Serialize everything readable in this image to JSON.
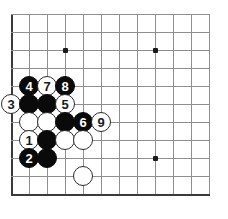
{
  "diagram": {
    "type": "go-board-diagram",
    "board": {
      "background_color": "#ffffff",
      "line_color": "#8f8f8f",
      "edge_color": "#3a3a3a",
      "origin_x": 11,
      "origin_y": 14,
      "cell_size": 18,
      "vertical_lines": 12,
      "horizontal_lines": 11,
      "edges": [
        "left",
        "bottom"
      ]
    },
    "star_points": [
      {
        "name": "star-point-upper-left",
        "x": 65,
        "y": 50
      },
      {
        "name": "star-point-upper-right",
        "x": 155,
        "y": 50
      },
      {
        "name": "star-point-lower-right",
        "x": 155,
        "y": 158
      }
    ],
    "stones": [
      {
        "id": "stone-4",
        "color": "black",
        "label": "4",
        "x": 29,
        "y": 86
      },
      {
        "id": "stone-7",
        "color": "white",
        "label": "7",
        "x": 47,
        "y": 86
      },
      {
        "id": "stone-8",
        "color": "black",
        "label": "8",
        "x": 65,
        "y": 86
      },
      {
        "id": "stone-3",
        "color": "white",
        "label": "3",
        "x": 11,
        "y": 104
      },
      {
        "id": "stone-b1",
        "color": "black",
        "label": "",
        "x": 29,
        "y": 104
      },
      {
        "id": "stone-b2",
        "color": "black",
        "label": "",
        "x": 47,
        "y": 104
      },
      {
        "id": "stone-5",
        "color": "white",
        "label": "5",
        "x": 65,
        "y": 104
      },
      {
        "id": "stone-w1",
        "color": "white",
        "label": "",
        "x": 29,
        "y": 122
      },
      {
        "id": "stone-w2",
        "color": "white",
        "label": "",
        "x": 47,
        "y": 122
      },
      {
        "id": "stone-b3",
        "color": "black",
        "label": "",
        "x": 65,
        "y": 122
      },
      {
        "id": "stone-6",
        "color": "black",
        "label": "6",
        "x": 83,
        "y": 122
      },
      {
        "id": "stone-9",
        "color": "white",
        "label": "9",
        "x": 101,
        "y": 122
      },
      {
        "id": "stone-1",
        "color": "white",
        "label": "1",
        "x": 29,
        "y": 140
      },
      {
        "id": "stone-b4",
        "color": "black",
        "label": "",
        "x": 47,
        "y": 140
      },
      {
        "id": "stone-w3",
        "color": "white",
        "label": "",
        "x": 65,
        "y": 140
      },
      {
        "id": "stone-w4",
        "color": "white",
        "label": "",
        "x": 83,
        "y": 140
      },
      {
        "id": "stone-2",
        "color": "black",
        "label": "2",
        "x": 29,
        "y": 158
      },
      {
        "id": "stone-b5",
        "color": "black",
        "label": "",
        "x": 47,
        "y": 158
      },
      {
        "id": "stone-w5",
        "color": "white",
        "label": "",
        "x": 83,
        "y": 176
      }
    ],
    "move_sequence": [
      "1",
      "2",
      "3",
      "4",
      "5",
      "6",
      "7",
      "8",
      "9"
    ],
    "colors": {
      "black_stone": "#0a0a0a",
      "white_stone": "#ffffff",
      "white_stone_border": "#2b2b2b",
      "grid": "#8f8f8f",
      "board_edge": "#3a3a3a",
      "star": "#1a1a1a"
    }
  }
}
